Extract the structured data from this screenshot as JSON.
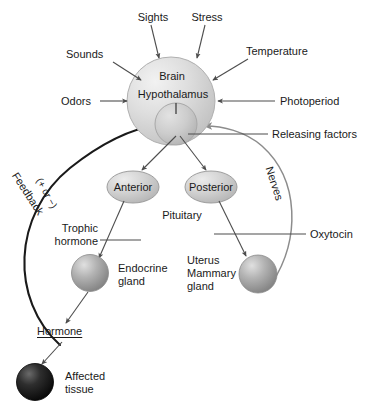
{
  "diagram": {
    "colors": {
      "brain_fill": "#d9d9d9",
      "pituitary_fill": "#c4c4c4",
      "lobe_fill": "#c9c9c9",
      "gland_fill": "#9a9a9a",
      "affected_tissue_fill": "#1c1c1c",
      "stroke": "#4d4d4d",
      "arrow": "#4d4d4d",
      "feedback_arc": "#1a1a1a",
      "nerves_arc": "#8c8c8c",
      "text": "#1a1a1a"
    },
    "inputs": [
      {
        "id": "sights",
        "label": "Sights"
      },
      {
        "id": "stress",
        "label": "Stress"
      },
      {
        "id": "sounds",
        "label": "Sounds"
      },
      {
        "id": "temperature",
        "label": "Temperature"
      },
      {
        "id": "odors",
        "label": "Odors"
      },
      {
        "id": "photoperiod",
        "label": "Photoperiod"
      }
    ],
    "structures": {
      "brain": "Brain",
      "hypothalamus": "Hypothalamus",
      "anterior": "Anterior",
      "posterior": "Posterior",
      "pituitary": "Pituitary",
      "endocrine_gland_line1": "Endocrine",
      "endocrine_gland_line2": "gland",
      "target_line1": "Uterus",
      "target_line2": "Mammary",
      "target_line3": "gland",
      "affected_line1": "Affected",
      "affected_line2": "tissue"
    },
    "signals": {
      "releasing_factors": "Releasing factors",
      "trophic_line1": "Trophic",
      "trophic_line2": "hormone",
      "oxytocin": "Oxytocin",
      "hormone": "Hormone",
      "feedback": "Feedback",
      "feedback_sign": "(+ or −)",
      "nerves": "Nerves"
    }
  }
}
